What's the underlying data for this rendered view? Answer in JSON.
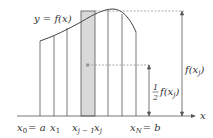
{
  "diagram": {
    "curve_label": "y = f(x)",
    "axis_label": "x",
    "tick_labels": {
      "x0": "x",
      "x0_sub": "0",
      "x0_eq": "= a",
      "x1": "x",
      "x1_sub": "1",
      "xjm1": "x",
      "xjm1_sub": "j − 1",
      "xj": "x",
      "xj_sub": "j",
      "xN": "x",
      "xN_sub": "N",
      "xN_eq": "= b"
    },
    "height_labels": {
      "full": "f(x",
      "full_sub": "j",
      "full_close": ")",
      "half_num": "1",
      "half_den": "2",
      "half": "f(x",
      "half_sub": "j",
      "half_close": ")"
    },
    "colors": {
      "line": "#555555",
      "shade": "#d9d9d9",
      "dashed": "#888888",
      "text": "#333333"
    }
  }
}
